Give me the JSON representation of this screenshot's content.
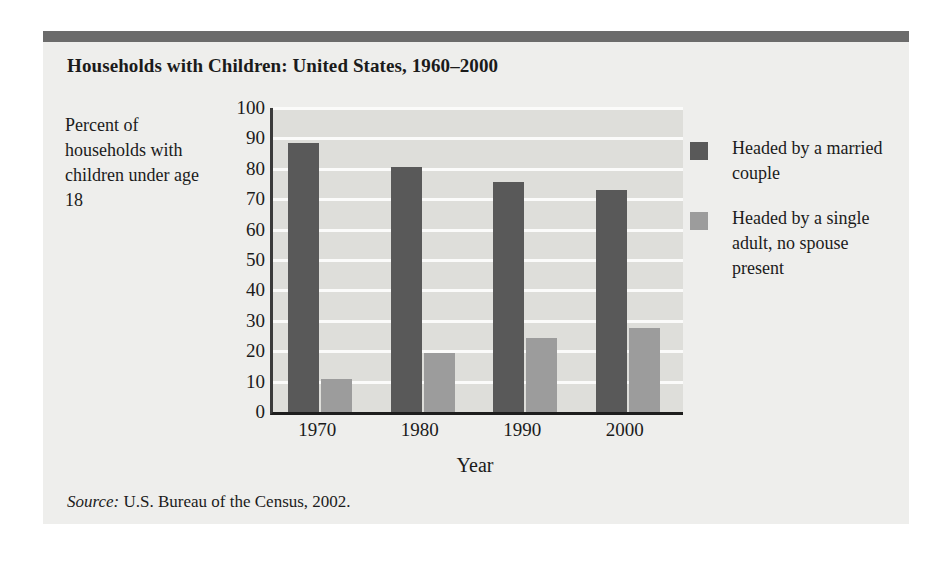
{
  "figure": {
    "title": "Households with Children: United States, 1960–2000",
    "source_word": "Source:",
    "source_text": " U.S. Bureau of the Census, 2002."
  },
  "colors": {
    "series_married": "#595959",
    "series_single": "#9c9c9c",
    "panel": "#dededa",
    "figure_background": "#eeeeec",
    "top_rule": "#6b6b6b",
    "gridline": "#fbfbfa",
    "text": "#1b1b1b"
  },
  "legend": {
    "position": "right",
    "items": [
      {
        "label": "Headed by a married couple",
        "swatch": "dark"
      },
      {
        "label": "Headed by a single adult, no spouse present",
        "swatch": "light"
      }
    ]
  },
  "chart_data": {
    "type": "bar",
    "title": "Households with Children: United States, 1960–2000",
    "subtitle": "",
    "xlabel": "Year",
    "ylabel": "Percent of households with children under age 18",
    "categories": [
      "1970",
      "1980",
      "1990",
      "2000"
    ],
    "series": [
      {
        "name": "Headed by a married couple",
        "values": [
          88.5,
          80.5,
          75.5,
          73
        ]
      },
      {
        "name": "Headed by a single adult, no spouse present",
        "values": [
          11,
          19.5,
          24.5,
          27.5
        ]
      }
    ],
    "ylim": [
      0,
      100
    ],
    "yticks": [
      0,
      10,
      20,
      30,
      40,
      50,
      60,
      70,
      80,
      90,
      100
    ],
    "ytick_labels": [
      "0",
      "10",
      "20",
      "30",
      "40",
      "50",
      "60",
      "70",
      "80",
      "90",
      "100"
    ],
    "grid": true,
    "grid_axis": "y",
    "legend_position": "right",
    "annotations": [
      "Source: U.S. Bureau of the Census, 2002."
    ]
  }
}
